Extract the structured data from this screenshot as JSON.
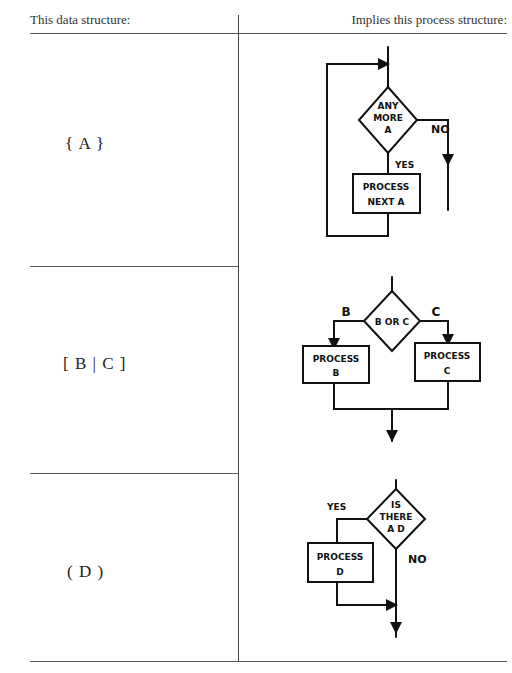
{
  "table": {
    "header_left": "This data structure:",
    "header_right": "Implies this process structure:",
    "rows": [
      {
        "data_structure": "{ A }",
        "process": {
          "type": "iteration",
          "decision": [
            "ANY",
            "MORE",
            "A"
          ],
          "yes_label": "YES",
          "no_label": "NO",
          "box": [
            "PROCESS",
            "NEXT A"
          ]
        }
      },
      {
        "data_structure": "[ B | C ]",
        "process": {
          "type": "selection",
          "decision": [
            "B OR C"
          ],
          "left_label": "B",
          "right_label": "C",
          "box_left": [
            "PROCESS",
            "B"
          ],
          "box_right": [
            "PROCESS",
            "C"
          ]
        }
      },
      {
        "data_structure": "( D )",
        "process": {
          "type": "option",
          "decision": [
            "IS",
            "THERE",
            "A D"
          ],
          "yes_label": "YES",
          "no_label": "NO",
          "box": [
            "PROCESS",
            "D"
          ]
        }
      }
    ]
  }
}
